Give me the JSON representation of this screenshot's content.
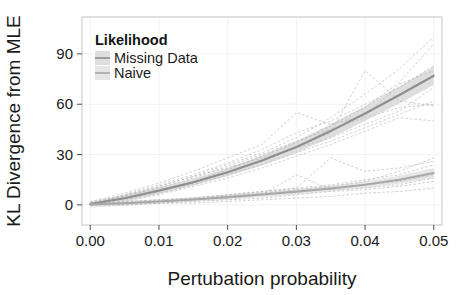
{
  "chart_data": {
    "type": "line",
    "title": "",
    "xlabel": "Pertubation probability",
    "ylabel": "KL Divergence from MLE",
    "xlim": [
      -0.0012,
      0.0512
    ],
    "ylim": [
      -12,
      112
    ],
    "xticks": [
      "0.00",
      "0.01",
      "0.02",
      "0.03",
      "0.04",
      "0.05"
    ],
    "xtick_values": [
      0.0,
      0.01,
      0.02,
      0.03,
      0.04,
      0.05
    ],
    "yticks": [
      "0",
      "30",
      "60",
      "90"
    ],
    "ytick_values": [
      0,
      30,
      60,
      90
    ],
    "grid": true,
    "grid_color": "#f2f2f2",
    "panel_background": "#ffffff",
    "panel_border_color": "#cccccc",
    "legend": {
      "title": "Likelihood",
      "position": "top-left-inside",
      "entries": [
        {
          "label": "Missing Data",
          "color": "#9a9a9a",
          "ribbon_color": "#d8d8d8"
        },
        {
          "label": "Naive",
          "color": "#b5b5b5",
          "ribbon_color": "#e2e2e2"
        }
      ]
    },
    "x": [
      0.0,
      0.005,
      0.01,
      0.015,
      0.02,
      0.025,
      0.03,
      0.035,
      0.04,
      0.045,
      0.05
    ],
    "series": [
      {
        "name": "Missing Data",
        "color": "#8f8f8f",
        "values": [
          0.5,
          4.0,
          8.5,
          13.5,
          19.5,
          26.5,
          34.5,
          44.0,
          54.5,
          65.5,
          77.0
        ],
        "ribbon_lower": [
          -1.0,
          2.0,
          6.5,
          11.5,
          17.0,
          23.5,
          31.0,
          40.0,
          50.0,
          60.5,
          71.5
        ],
        "ribbon_upper": [
          2.0,
          6.0,
          10.5,
          15.5,
          22.0,
          29.5,
          38.0,
          48.0,
          59.0,
          70.5,
          82.5
        ]
      },
      {
        "name": "Naive",
        "color": "#a8a8a8",
        "values": [
          0.3,
          1.0,
          2.0,
          3.2,
          4.6,
          6.2,
          7.9,
          9.8,
          12.0,
          15.0,
          19.0
        ],
        "ribbon_lower": [
          -1.5,
          -0.5,
          0.6,
          1.8,
          3.0,
          4.6,
          6.2,
          8.0,
          10.0,
          12.6,
          16.0
        ],
        "ribbon_upper": [
          2.1,
          2.5,
          3.4,
          4.6,
          6.2,
          7.8,
          9.6,
          11.6,
          14.0,
          17.4,
          22.0
        ]
      }
    ],
    "individual_runs_note": "thin dashed gray traces for individual replicates",
    "individual_runs": [
      {
        "group": "Missing Data",
        "y": [
          0,
          5,
          11,
          17,
          24,
          31,
          40,
          52,
          66,
          81,
          100
        ]
      },
      {
        "group": "Missing Data",
        "y": [
          1,
          4,
          9,
          14,
          21,
          29,
          37,
          47,
          58,
          73,
          96
        ]
      },
      {
        "group": "Missing Data",
        "y": [
          0,
          6,
          12,
          18,
          25,
          33,
          43,
          50,
          60,
          70,
          83
        ]
      },
      {
        "group": "Missing Data",
        "y": [
          2,
          7,
          13,
          20,
          28,
          36,
          55,
          48,
          53,
          72,
          80
        ]
      },
      {
        "group": "Missing Data",
        "y": [
          0,
          3,
          7,
          12,
          18,
          24,
          31,
          38,
          46,
          54,
          62
        ]
      },
      {
        "group": "Missing Data",
        "y": [
          1,
          5,
          10,
          16,
          23,
          30,
          38,
          45,
          52,
          58,
          60
        ]
      },
      {
        "group": "Missing Data",
        "y": [
          0,
          4,
          8,
          13,
          19,
          26,
          34,
          43,
          80,
          62,
          59
        ]
      },
      {
        "group": "Missing Data",
        "y": [
          0,
          2,
          6,
          11,
          16,
          22,
          29,
          36,
          44,
          52,
          50
        ]
      },
      {
        "group": "Missing Data",
        "y": [
          1,
          6,
          11,
          17,
          22,
          28,
          34,
          40,
          48,
          56,
          70
        ]
      },
      {
        "group": "Naive",
        "y": [
          0,
          1,
          2,
          3,
          5,
          7,
          9,
          11,
          14,
          20,
          28
        ]
      },
      {
        "group": "Naive",
        "y": [
          1,
          2,
          3,
          4,
          6,
          8,
          10,
          28,
          20,
          22,
          26
        ]
      },
      {
        "group": "Naive",
        "y": [
          0,
          1,
          2,
          3,
          4,
          6,
          8,
          10,
          12,
          14,
          18
        ]
      },
      {
        "group": "Naive",
        "y": [
          0,
          0,
          1,
          2,
          3,
          4,
          6,
          8,
          9,
          11,
          14
        ]
      },
      {
        "group": "Naive",
        "y": [
          1,
          1,
          2,
          3,
          5,
          6,
          18,
          9,
          10,
          12,
          16
        ]
      },
      {
        "group": "Naive",
        "y": [
          0,
          1,
          3,
          4,
          6,
          8,
          10,
          12,
          15,
          18,
          24
        ]
      },
      {
        "group": "Naive",
        "y": [
          0,
          0,
          1,
          1,
          2,
          3,
          4,
          5,
          7,
          8,
          10
        ]
      }
    ]
  },
  "figure": {
    "xlabel": "Pertubation probability",
    "ylabel": "KL Divergence from MLE",
    "legend_title": "Likelihood",
    "legend_items": [
      {
        "label": "Missing Data"
      },
      {
        "label": "Naive"
      }
    ],
    "xtick_labels": [
      "0.00",
      "0.01",
      "0.02",
      "0.03",
      "0.04",
      "0.05"
    ],
    "ytick_labels": [
      "0",
      "30",
      "60",
      "90"
    ]
  }
}
